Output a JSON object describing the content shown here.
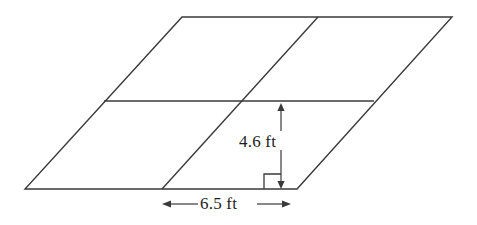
{
  "figure": {
    "kind": "parallelogram-divided-diagram",
    "background_color": "#ffffff",
    "stroke_color": "#3a3a3a",
    "text_color": "#1d1d1d",
    "stroke_width": 1.4,
    "outline": {
      "name": "outer-parallelogram",
      "vertices": [
        {
          "name": "top-left",
          "x": 182,
          "y": 17
        },
        {
          "name": "top-right",
          "x": 452,
          "y": 17
        },
        {
          "name": "bottom-right",
          "x": 297,
          "y": 189
        },
        {
          "name": "bottom-left",
          "x": 25,
          "y": 189
        }
      ],
      "points_attr": "182,17 452,17 297,189 25,189"
    },
    "interior_lines": [
      {
        "name": "horizontal-midline",
        "x1": 104,
        "y1": 101,
        "x2": 374,
        "y2": 101
      },
      {
        "name": "slanted-midline",
        "x1": 318,
        "y1": 17,
        "x2": 162,
        "y2": 189
      }
    ],
    "height_dimension": {
      "name": "height-dimension",
      "value": "4.6 ft",
      "number": 4.6,
      "unit": "ft",
      "axis_x": 281,
      "axis_top_y": 103,
      "axis_bottom_y": 189,
      "arrow_up_path": "M 281,103 L 277.4,111 L 284.6,111 Z",
      "arrow_down_path": "M 281,189 L 277.4,181 L 284.6,181 Z",
      "line_upper": {
        "x1": 281,
        "y1": 105,
        "x2": 281,
        "y2": 131
      },
      "line_lower": {
        "x1": 281,
        "y1": 150,
        "x2": 281,
        "y2": 187
      }
    },
    "right_angle_marker": {
      "name": "right-angle-marker",
      "path": "M 264,189 L 264,174 L 281,174",
      "size": 15
    },
    "base_dimension": {
      "name": "base-dimension",
      "value": "6.5 ft",
      "number": 6.5,
      "unit": "ft",
      "axis_y": 204,
      "left_tip_x": 162,
      "right_tip_x": 291,
      "arrow_left_path": "M 162,204 L 171,200.6 L 171,207.4 Z",
      "arrow_right_path": "M 291,204 L 282,200.6 L 282,207.4 Z",
      "line_left": {
        "x1": 169,
        "y1": 204,
        "x2": 198,
        "y2": 204
      },
      "line_right": {
        "x1": 257,
        "y1": 204,
        "x2": 284,
        "y2": 204
      }
    }
  }
}
